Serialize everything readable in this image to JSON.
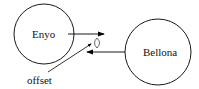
{
  "diagram": {
    "nodes": [
      {
        "id": "enyo",
        "label": "Enyo",
        "cx": 44,
        "cy": 34,
        "r": 30
      },
      {
        "id": "bellona",
        "label": "Bellona",
        "cx": 158,
        "cy": 52,
        "r": 33
      }
    ],
    "edges": [
      {
        "from": "enyo",
        "to": "bellona-side",
        "direction": "right",
        "y": 34
      },
      {
        "from": "bellona",
        "to": "enyo-side",
        "direction": "left",
        "y": 52
      }
    ],
    "annotation": {
      "label": "offset",
      "points_to": "gap between arrows"
    },
    "colors": {
      "stroke": "#000000",
      "background": "#ffffff"
    }
  }
}
